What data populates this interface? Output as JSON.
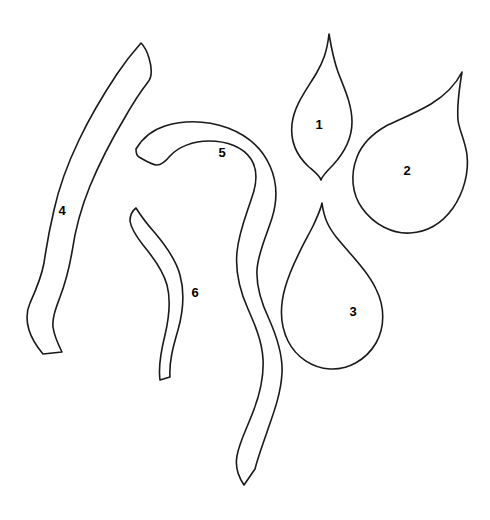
{
  "figure": {
    "background_color": "#ffffff",
    "stroke_color": "#1a1a1a",
    "label_color": "#000000",
    "width": 490,
    "height": 520,
    "shape_count": 6
  },
  "shapes": [
    {
      "id": "shape-1",
      "label": "1",
      "label_x": 319,
      "label_y": 124,
      "kind": "flame-leaf",
      "description": "narrow pointed leaf, tip up, broad lower body",
      "path": "M 329 34 C 327 52 323 62 316 74 C 305 92 294 106 292 124 C 290 142 297 156 309 167 C 316 173 320 176 321 180 C 322 176 327 171 333 165 C 344 153 352 139 352 122 C 352 104 344 88 338 72 C 333 58 331 46 329 34 Z"
    },
    {
      "id": "shape-2",
      "label": "2",
      "label_x": 407,
      "label_y": 170,
      "kind": "teardrop-leaf",
      "description": "broad leaf with slender tip toward upper right",
      "path": "M 462 72 C 455 86 444 96 431 104 C 414 114 398 120 386 126 C 372 134 362 144 357 157 C 350 175 352 194 362 208 C 374 225 393 234 410 233 C 428 232 443 222 453 208 C 464 192 469 172 467 155 C 465 140 459 130 458 120 C 457 108 459 90 462 72 Z"
    },
    {
      "id": "shape-3",
      "label": "3",
      "label_x": 353,
      "label_y": 311,
      "kind": "teardrop",
      "description": "teardrop with sharp point at top, rounded bottom",
      "path": "M 322 203 C 324 219 329 228 337 238 C 352 256 368 272 376 289 C 385 307 385 327 376 343 C 366 360 348 370 330 369 C 312 368 296 357 288 341 C 280 325 280 306 285 288 C 292 263 305 242 313 226 C 318 215 321 209 322 203 Z"
    },
    {
      "id": "shape-4",
      "label": "4",
      "label_x": 62,
      "label_y": 210,
      "kind": "curved-strip",
      "description": "long slender curved band running top-right to bottom-left",
      "path": "M 141 43 C 133 52 125 62 117 74 C 103 95 90 117 79 140 C 68 163 59 187 54 210 C 49 231 46 249 44 263 C 41 279 35 292 30 303 C 26 312 26 320 29 330 C 32 340 38 348 43 354 L 62 352 C 58 344 54 335 53 327 C 52 318 56 308 60 297 C 65 284 69 269 72 252 C 75 231 81 208 90 186 C 100 162 112 139 124 119 C 133 103 141 91 148 82 C 152 77 152 68 149 58 C 147 51 144 46 141 43 Z"
    },
    {
      "id": "shape-5",
      "label": "5",
      "label_x": 222,
      "label_y": 152,
      "kind": "hooked-strip",
      "description": "long S-curved band with a hook at the top left, tapering to a point at bottom",
      "path": "M 136 149 C 142 139 152 130 165 126 C 185 120 208 121 228 128 C 249 136 263 150 270 166 C 278 184 277 202 272 218 C 266 237 258 253 257 270 C 256 288 262 304 269 319 C 277 337 283 355 282 373 C 281 393 274 412 268 429 C 263 444 258 457 255 469 L 244 485 C 238 476 235 466 237 456 C 239 443 247 428 253 412 C 260 394 264 376 263 359 C 262 341 255 325 248 309 C 240 291 235 272 237 252 C 239 231 247 213 252 197 C 257 183 258 170 251 159 C 243 147 227 141 209 141 C 193 141 178 147 170 156 C 165 162 161 165 157 165 C 152 165 146 161 139 157 C 137 156 136 153 136 149 Z"
    },
    {
      "id": "shape-6",
      "label": "6",
      "label_x": 195,
      "label_y": 292,
      "kind": "wavy-strip",
      "description": "short S-curved band, narrow, vertical",
      "path": "M 136 208 C 141 216 147 224 155 233 C 166 246 176 260 180 275 C 185 293 183 312 178 330 C 173 347 169 362 170 377 L 160 380 C 158 366 161 351 165 335 C 169 318 171 300 167 285 C 163 270 153 257 143 245 C 136 236 131 228 130 221 C 130 216 132 211 136 208 Z"
    }
  ]
}
